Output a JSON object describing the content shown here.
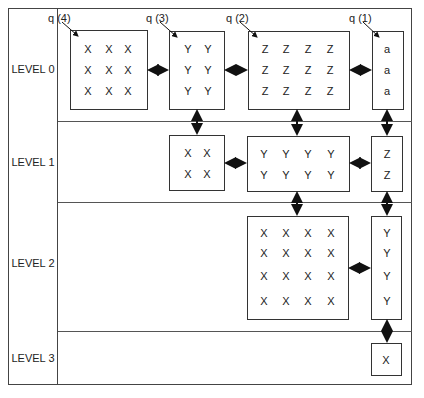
{
  "levels": [
    "LEVEL 0",
    "LEVEL 1",
    "LEVEL 2",
    "LEVEL 3"
  ],
  "queue_labels": [
    "q (4)",
    "q (3)",
    "q (2)",
    "q (1)"
  ],
  "level0": {
    "q4": [
      [
        "X",
        "X",
        "X"
      ],
      [
        "X",
        "X",
        "X"
      ],
      [
        "X",
        "X",
        "X"
      ]
    ],
    "q3": [
      [
        "Y",
        "Y"
      ],
      [
        "Y",
        "Y"
      ],
      [
        "Y",
        "Y"
      ]
    ],
    "q2": [
      [
        "Z",
        "Z",
        "Z",
        "Z"
      ],
      [
        "Z",
        "Z",
        "Z",
        "Z"
      ],
      [
        "Z",
        "Z",
        "Z",
        "Z"
      ]
    ],
    "q1": [
      [
        "a"
      ],
      [
        "a"
      ],
      [
        "a"
      ]
    ]
  },
  "level1": {
    "b1": [
      [
        "X",
        "X"
      ],
      [
        "X",
        "X"
      ]
    ],
    "b2": [
      [
        "Y",
        "Y",
        "Y",
        "Y"
      ],
      [
        "Y",
        "Y",
        "Y",
        "Y"
      ]
    ],
    "b3": [
      [
        "Z"
      ],
      [
        "Z"
      ]
    ]
  },
  "level2": {
    "b1": [
      [
        "X",
        "X",
        "X",
        "X"
      ],
      [
        "X",
        "X",
        "X",
        "X"
      ],
      [
        "X",
        "X",
        "X",
        "X"
      ],
      [
        "X",
        "X",
        "X",
        "X"
      ]
    ],
    "b2": [
      [
        "Y"
      ],
      [
        "Y"
      ],
      [
        "Y"
      ],
      [
        "Y"
      ]
    ]
  },
  "level3": {
    "b1": [
      [
        "X"
      ]
    ]
  }
}
